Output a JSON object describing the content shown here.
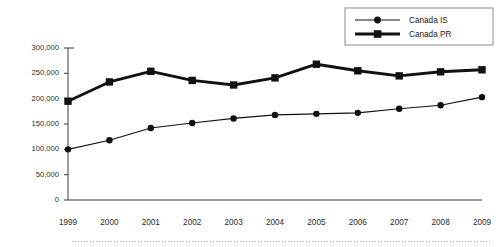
{
  "chart_data": {
    "type": "line",
    "title": "",
    "subtitle": "",
    "xlabel": "",
    "ylabel": "",
    "categories": [
      "1999",
      "2000",
      "2001",
      "2002",
      "2003",
      "2004",
      "2005",
      "2006",
      "2007",
      "2008",
      "2009"
    ],
    "series": [
      {
        "name": "Canada IS",
        "marker": "circle",
        "line_weight": "thin",
        "color": "#111111",
        "values": [
          100000,
          118000,
          142000,
          152000,
          161000,
          168000,
          170000,
          172000,
          180000,
          187000,
          203000
        ]
      },
      {
        "name": "Canada PR",
        "marker": "square",
        "line_weight": "thick",
        "color": "#111111",
        "values": [
          195000,
          233000,
          254000,
          236000,
          227000,
          241000,
          268000,
          255000,
          245000,
          253000,
          257000
        ]
      }
    ],
    "ylim": [
      0,
      300000
    ],
    "yticks": [
      0,
      50000,
      100000,
      150000,
      200000,
      250000,
      300000
    ],
    "ytick_labels": [
      "0",
      "50,000",
      "100,000",
      "150,000",
      "200,000",
      "250,000",
      "300,000"
    ],
    "grid": false,
    "legend_position": "top-right",
    "legend_entries": [
      "Canada IS",
      "Canada PR"
    ]
  },
  "axes": {
    "y_axis_name": "y-axis",
    "x_axis_name": "x-axis"
  }
}
